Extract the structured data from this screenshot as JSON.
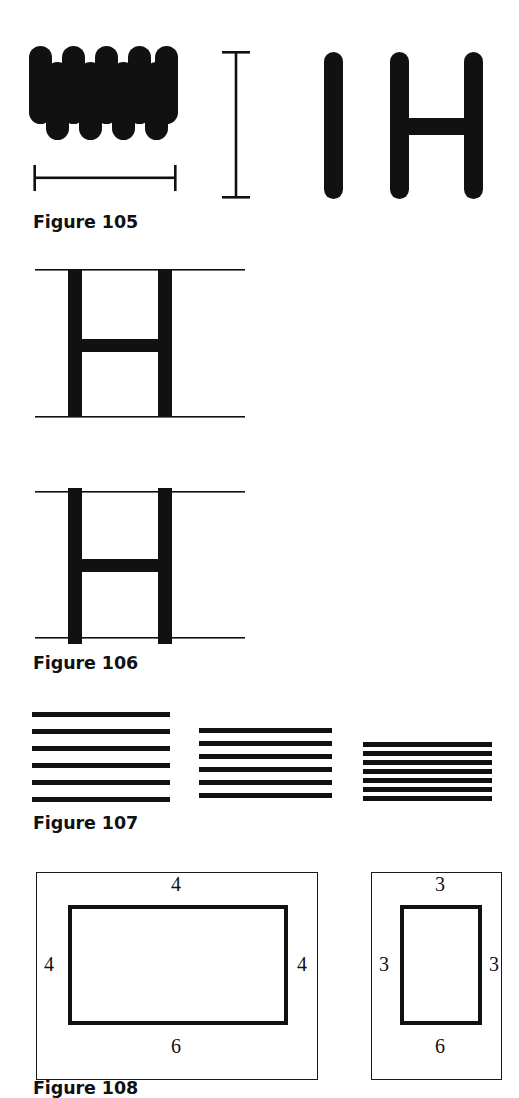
{
  "page": {
    "background": "#ffffff",
    "ink": "#111111",
    "width": 519,
    "height": 1092
  },
  "figures": [
    {
      "id": "figure-105",
      "caption": "Figure 105",
      "caption_x": 33,
      "caption_y": 212,
      "description": "Dense zigzag scribble block, a horizontal I-beam width gauge, a vertical I-beam height gauge, a single thick vertical stroke, and a thick letter H",
      "elements": {
        "scribble": {
          "name": "zigzag-scribble-block",
          "x": 28,
          "y": 46,
          "width": 150,
          "height": 92,
          "stroke_count": 6,
          "stroke_width": 23
        },
        "width_gauge": {
          "name": "horizontal-i-beam-gauge",
          "x1": 34,
          "x2": 176,
          "y": 178,
          "cap_height": 26
        },
        "height_gauge": {
          "name": "vertical-i-beam-gauge",
          "x": 236,
          "y1": 52,
          "y2": 198,
          "cap_width": 28
        },
        "bar": {
          "name": "thick-vertical-stroke",
          "x": 324,
          "y": 52,
          "width": 19,
          "height": 147
        },
        "letter_h": {
          "name": "letter-h-glyph",
          "left_x": 390,
          "right_x": 464,
          "y": 52,
          "height": 147,
          "stroke_width": 19,
          "crossbar_y": 118,
          "crossbar_height": 17
        }
      }
    },
    {
      "id": "figure-106",
      "caption": "Figure 106",
      "caption_x": 33,
      "caption_y": 653,
      "description": "Two letter H glyphs each set between a pair of thin horizontal guide lines; in the first the stems stop at the guides, in the second the stems overshoot them",
      "elements": {
        "h_top": {
          "name": "letter-h-between-guides-aligned",
          "guide_left": 35,
          "guide_right": 245,
          "guide_top_y": 270,
          "guide_bottom_y": 417,
          "left_stem_x": 68,
          "right_stem_x": 158,
          "stem_width": 14,
          "crossbar_y": 340,
          "crossbar_height": 13,
          "overshoot_top": 0,
          "overshoot_bottom": 0
        },
        "h_bottom": {
          "name": "letter-h-between-guides-overshoot",
          "guide_left": 35,
          "guide_right": 245,
          "guide_top_y": 492,
          "guide_bottom_y": 638,
          "left_stem_x": 68,
          "right_stem_x": 158,
          "stem_width": 14,
          "crossbar_y": 560,
          "crossbar_height": 13,
          "overshoot_top": 3,
          "overshoot_bottom": 5
        }
      }
    },
    {
      "id": "figure-107",
      "caption": "Figure 107",
      "caption_x": 33,
      "caption_y": 813,
      "description": "Three blocks of parallel horizontal rules with progressively tighter line spacing from left to right",
      "groups": [
        {
          "name": "line-group-wide",
          "x": 32,
          "width": 138,
          "top": 712,
          "count": 6,
          "spacing": 17,
          "thickness": 5
        },
        {
          "name": "line-group-medium",
          "x": 199,
          "width": 133,
          "top": 728,
          "count": 6,
          "spacing": 13,
          "thickness": 5
        },
        {
          "name": "line-group-tight",
          "x": 363,
          "width": 129,
          "top": 742,
          "count": 7,
          "spacing": 9,
          "thickness": 5
        }
      ]
    },
    {
      "id": "figure-108",
      "caption": "Figure 108",
      "caption_x": 33,
      "caption_y": 1078,
      "description": "Two framed diagrams of a bold rectangle with side-length labels written outside each edge",
      "panels": [
        {
          "name": "panel-wide-rectangle",
          "outer": {
            "x": 36,
            "y": 872,
            "width": 282,
            "height": 208
          },
          "inner": {
            "x": 68,
            "y": 905,
            "width": 220,
            "height": 120
          },
          "labels": {
            "top": "4",
            "left": "4",
            "right": "4",
            "bottom": "6"
          }
        },
        {
          "name": "panel-narrow-rectangle",
          "outer": {
            "x": 371,
            "y": 872,
            "width": 131,
            "height": 208
          },
          "inner": {
            "x": 400,
            "y": 905,
            "width": 82,
            "height": 120
          },
          "labels": {
            "top": "3",
            "left": "3",
            "right": "3",
            "bottom": "6"
          }
        }
      ]
    }
  ]
}
